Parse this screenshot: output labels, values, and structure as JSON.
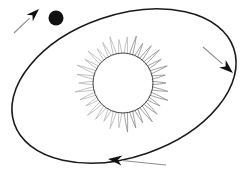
{
  "canvas": {
    "width": 242,
    "height": 175,
    "background": "#ffffff",
    "title": "Planet orbiting the Sun on an elliptical path"
  },
  "colors": {
    "orbit_stroke": "#1a1a1a",
    "planet_fill": "#111111",
    "sun_core_stroke": "#4a4a4a",
    "sun_ray_stroke": "#8a8a8a",
    "sun_ray_stroke_faint": "#b4b4b4",
    "arrow_head_fill": "#111111",
    "arrow_tail_stroke": "#8d8d8d"
  },
  "sun": {
    "label": "sun",
    "center_x": 123,
    "center_y": 83,
    "core_radius": 30,
    "ray_outer_radius": 47,
    "ray_count": 34,
    "core_stroke_width": 1.0,
    "ray_stroke_width": 0.8
  },
  "planet": {
    "label": "planet",
    "center_x": 56,
    "center_y": 18,
    "radius": 7.5
  },
  "orbit": {
    "label": "elliptical-orbit",
    "center_x": 124,
    "center_y": 86,
    "semi_major": 116,
    "semi_minor": 71,
    "rotation_deg": -19,
    "stroke_width": 1.6
  },
  "direction_arrows": [
    {
      "name": "arrow-top-left",
      "direction": "up-right",
      "tail_x": 14,
      "tail_y": 33,
      "tip_x": 39,
      "tip_y": 9,
      "head_angle_deg": -44,
      "head_length": 13,
      "head_width": 9
    },
    {
      "name": "arrow-right",
      "direction": "down-right",
      "tail_x": 203,
      "tail_y": 47,
      "tip_x": 233,
      "tip_y": 73,
      "head_angle_deg": 41,
      "head_length": 14,
      "head_width": 10
    },
    {
      "name": "arrow-bottom",
      "direction": "left",
      "tail_x": 166,
      "tail_y": 165,
      "tip_x": 108,
      "tip_y": 159,
      "head_angle_deg": 186,
      "head_length": 14,
      "head_width": 10
    }
  ]
}
